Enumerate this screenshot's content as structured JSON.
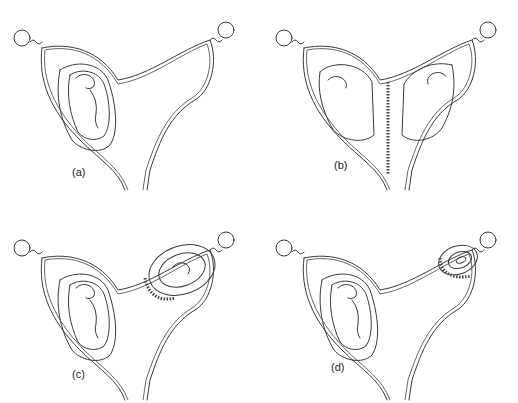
{
  "figure": {
    "panels": [
      {
        "id": "a",
        "label": "(a)",
        "content": "single fetus in left horn"
      },
      {
        "id": "b",
        "label": "(b)",
        "content": "two fetuses, one in each horn, separated by a septum"
      },
      {
        "id": "c",
        "label": "(c)",
        "content": "large fetus in left horn, smaller fetus in right horn with placenta"
      },
      {
        "id": "d",
        "label": "(d)",
        "content": "large fetus in left horn, small early gestation sac in right horn"
      }
    ]
  },
  "colors": {
    "line": "#3a3a3a",
    "background": "#ffffff"
  }
}
